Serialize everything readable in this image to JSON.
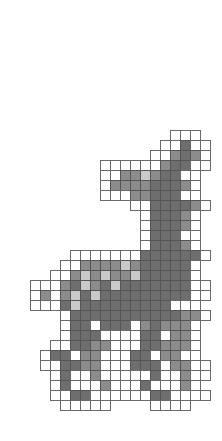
{
  "drawing": {
    "subject": "pixel-art deer on grid paper",
    "origin_x": 20,
    "origin_y": 130,
    "cell_size": 10,
    "colors": {
      "o": "#ffffff",
      "l": "#c9c9c9",
      "m": "#8c8c8c",
      "d": "#6e6e6e",
      "line": "#555555"
    },
    "rows": [
      {
        "start": 15,
        "cells": "ooo"
      },
      {
        "start": 14,
        "cells": "oodoo"
      },
      {
        "start": 13,
        "cells": "oomdmo"
      },
      {
        "start": 8,
        "cells": "oooooomddoo"
      },
      {
        "start": 8,
        "cells": "oommlmddoo"
      },
      {
        "start": 8,
        "cells": "ommmmdddmo"
      },
      {
        "start": 8,
        "cells": "ooommdddoo"
      },
      {
        "start": 11,
        "cells": "ooddddmo"
      },
      {
        "start": 12,
        "cells": "odddmo"
      },
      {
        "start": 12,
        "cells": "odddmo"
      },
      {
        "start": 12,
        "cells": "odddoo"
      },
      {
        "start": 12,
        "cells": "odddmo"
      },
      {
        "start": 5,
        "cells": "oooooooddddddo"
      },
      {
        "start": 4,
        "cells": "oommmmlmdddddo"
      },
      {
        "start": 3,
        "cells": "oomlmlmmldddddo"
      },
      {
        "start": 1,
        "cells": "ooomdlmdldddddddoo"
      },
      {
        "start": 1,
        "cells": "omomldldddddddddoo"
      },
      {
        "start": 1,
        "cells": "ooodldddddddddooo"
      },
      {
        "start": 4,
        "cells": "odddddddddddmmo"
      },
      {
        "start": 4,
        "cells": "oddodddomdmmmo"
      },
      {
        "start": 4,
        "cells": "odddooooddommo"
      },
      {
        "start": 3,
        "cells": "ooddmmoooddmmmo"
      },
      {
        "start": 2,
        "cells": "oddommoooddommoo"
      },
      {
        "start": 2,
        "cells": "ooddmmooodddommoo"
      },
      {
        "start": 3,
        "cells": "odoomooooodoomoo"
      },
      {
        "start": 3,
        "cells": "odooomooodooomo"
      },
      {
        "start": 3,
        "cells": "ooddooooooddoooo"
      },
      {
        "start": 4,
        "cells": "ooooo....oooo"
      }
    ]
  }
}
